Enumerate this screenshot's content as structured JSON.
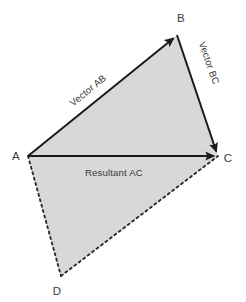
{
  "diagram": {
    "canvas": {
      "width": 246,
      "height": 302
    },
    "colors": {
      "fill": "#d8d8d8",
      "stroke": "#1a1a1a",
      "dashed_stroke": "#2b2b2b",
      "text": "#3a3a3a",
      "background": "#ffffff"
    },
    "vertices": [
      {
        "id": "A",
        "label": "A",
        "x": 28,
        "y": 156,
        "label_x": 16,
        "label_y": 160
      },
      {
        "id": "B",
        "label": "B",
        "x": 177,
        "y": 35,
        "label_x": 181,
        "label_y": 22
      },
      {
        "id": "C",
        "label": "C",
        "x": 218,
        "y": 156,
        "label_x": 228,
        "label_y": 162
      },
      {
        "id": "D",
        "label": "D",
        "x": 61,
        "y": 276,
        "label_x": 57,
        "label_y": 295
      }
    ],
    "edges": [
      {
        "id": "AB",
        "label": "Vector AB",
        "style": "solid",
        "arrow": true,
        "from": "A",
        "to": "B",
        "label_x": 90,
        "label_y": 93,
        "label_rotation": -39
      },
      {
        "id": "BC",
        "label": "Vector BC",
        "style": "solid",
        "arrow": true,
        "from": "B",
        "to": "C",
        "label_x": 206,
        "label_y": 64,
        "label_rotation": 71
      },
      {
        "id": "AC",
        "label": "Resultant AC",
        "style": "solid",
        "arrow": true,
        "from": "A",
        "to": "C",
        "label_x": 85,
        "label_y": 176,
        "label_rotation": 0
      },
      {
        "id": "AD",
        "label": "",
        "style": "dashed",
        "arrow": false,
        "from": "A",
        "to": "D",
        "label_x": 0,
        "label_y": 0,
        "label_rotation": 0
      },
      {
        "id": "DC",
        "label": "",
        "style": "dashed",
        "arrow": false,
        "from": "D",
        "to": "C",
        "label_x": 0,
        "label_y": 0,
        "label_rotation": 0
      }
    ]
  }
}
